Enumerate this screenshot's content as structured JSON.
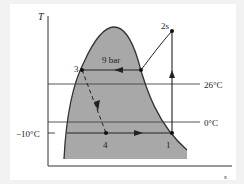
{
  "diagram": {
    "type": "T-s diagram (vapor-compression refrigeration cycle)",
    "axes": {
      "y_label": "T",
      "x_label": "s"
    },
    "isotherms": [
      {
        "label": "26°C"
      },
      {
        "label": "0°C"
      }
    ],
    "tick_label": "−10°C",
    "pressure_label": "9 bar",
    "states": [
      {
        "id": "1",
        "label": "1"
      },
      {
        "id": "2s",
        "label": "2s"
      },
      {
        "id": "3",
        "label": "3"
      },
      {
        "id": "4",
        "label": "4"
      }
    ],
    "colors": {
      "dome_fill": "#a8a8a8",
      "lines": "#333333",
      "background": "#ffffff",
      "page": "#f2f2f2"
    }
  }
}
